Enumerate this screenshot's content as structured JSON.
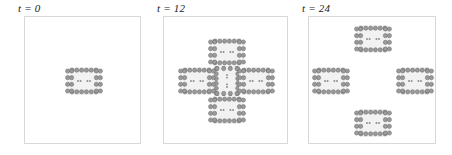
{
  "figure": {
    "type": "simulation-snapshot-series",
    "background": "#ffffff",
    "border_color": "#d8d8d8",
    "bead_fill": "#9a9a9a",
    "bead_stroke": "#6e6e6e",
    "inner_dot_color": "#8a8a8a",
    "halo_color": "#f2f2f2"
  },
  "panels": [
    {
      "id": "panel-t0",
      "label": "t = 0",
      "time": 0,
      "x": 24,
      "y": 16,
      "width": 117,
      "height": 128,
      "label_x": 18,
      "unit_count": 1,
      "units": [
        {
          "cx": 58.5,
          "cy": 64.0,
          "rot": 0
        }
      ]
    },
    {
      "id": "panel-t12",
      "label": "t = 12",
      "time": 12,
      "x": 163,
      "y": 16,
      "width": 125,
      "height": 128,
      "label_x": 157,
      "unit_count": 5,
      "units": [
        {
          "cx": 62.5,
          "cy": 64.0,
          "rot": 90
        },
        {
          "cx": 62.5,
          "cy": 35.0,
          "rot": 0
        },
        {
          "cx": 62.5,
          "cy": 93.0,
          "rot": 0
        },
        {
          "cx": 33.0,
          "cy": 64.0,
          "rot": 0
        },
        {
          "cx": 92.0,
          "cy": 64.0,
          "rot": 0
        }
      ]
    },
    {
      "id": "panel-t24",
      "label": "t = 24",
      "time": 24,
      "x": 308,
      "y": 16,
      "width": 128,
      "height": 128,
      "label_x": 302,
      "unit_count": 4,
      "units": [
        {
          "cx": 64.0,
          "cy": 22.0,
          "rot": 0
        },
        {
          "cx": 64.0,
          "cy": 106.0,
          "rot": 0
        },
        {
          "cx": 22.0,
          "cy": 64.0,
          "rot": 0
        },
        {
          "cx": 106.0,
          "cy": 64.0,
          "rot": 0
        }
      ]
    }
  ],
  "unit_template": {
    "name": "bead-ring-capsule",
    "width": 40,
    "height": 32,
    "bead_radius": 2.1,
    "top_row_beads": 6,
    "bottom_row_beads": 6,
    "left_col_beads": 4,
    "right_col_beads": 4,
    "inner_dots": 4
  }
}
